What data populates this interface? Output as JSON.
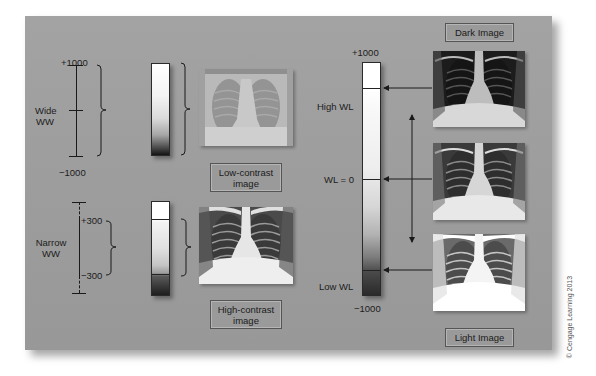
{
  "diagram": {
    "colors": {
      "panel_background": "#9d9d9d",
      "line": "#1a1a1a",
      "label_box_border": "#555555"
    },
    "wide_ww": {
      "label_line1": "Wide",
      "label_line2": "WW",
      "top_value": "+1000",
      "bottom_value": "−1000"
    },
    "narrow_ww": {
      "label_line1": "Narrow",
      "label_line2": "WW",
      "upper_value": "+300",
      "lower_value": "−300"
    },
    "low_contrast": {
      "caption_line1": "Low-contrast",
      "caption_line2": "image"
    },
    "high_contrast": {
      "caption_line1": "High-contrast",
      "caption_line2": "image"
    },
    "window_level": {
      "top_value": "+1000",
      "bottom_value": "−1000",
      "high_label": "High WL",
      "zero_label": "WL = 0",
      "low_label": "Low WL"
    },
    "dark_image_label": "Dark Image",
    "light_image_label": "Light Image",
    "images": [
      {
        "name": "low-contrast-xray",
        "description": "washed-out chest x-ray"
      },
      {
        "name": "high-contrast-xray",
        "description": "high-contrast chest x-ray"
      },
      {
        "name": "dark-xray",
        "description": "dark chest x-ray (high WL)"
      },
      {
        "name": "normal-xray",
        "description": "chest x-ray (WL = 0)"
      },
      {
        "name": "light-xray",
        "description": "light chest x-ray (low WL)"
      }
    ],
    "copyright": "© Cengage Learning 2013"
  }
}
